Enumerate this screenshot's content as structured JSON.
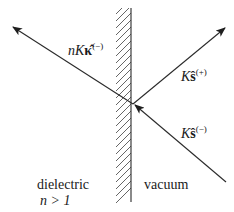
{
  "diagram": {
    "title": "",
    "colors": {
      "line": "#2a2a2a",
      "hatch": "#555555",
      "background": "#ffffff"
    },
    "interface": {
      "x": 131,
      "y_top": 8,
      "y_bottom": 202,
      "hatch_side": "left",
      "hatch_width": 15
    },
    "intersection": {
      "x": 133,
      "y": 104
    },
    "rays": [
      {
        "id": "refracted",
        "from": [
          133,
          104
        ],
        "to": [
          13,
          27
        ],
        "arrow_at": "end",
        "label": "nKκ̂(−)"
      },
      {
        "id": "reflected",
        "from": [
          133,
          104
        ],
        "to": [
          225,
          28
        ],
        "arrow_at": "end",
        "label": "Kŝ(+)"
      },
      {
        "id": "incident",
        "from": [
          226,
          182
        ],
        "to": [
          134,
          105
        ],
        "arrow_at": "end",
        "label": "Kŝ(−)"
      }
    ],
    "labels": {
      "refracted": {
        "prefix": "nK",
        "vector": "κ̂",
        "sup": "(−)"
      },
      "reflected": {
        "prefix": "K",
        "vector": "ŝ",
        "sup": "(+)"
      },
      "incident": {
        "prefix": "K",
        "vector": "ŝ",
        "sup": "(−)"
      },
      "left_region_name": "dielectric",
      "left_region_condition": "n > 1",
      "right_region_name": "vacuum"
    }
  }
}
